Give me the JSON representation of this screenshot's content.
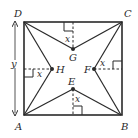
{
  "figure": {
    "type": "geometry-diagram",
    "colors": {
      "stroke": "#2a2a2a",
      "background": "#ffffff"
    }
  },
  "vertices": {
    "A": {
      "label": "A",
      "x": 24,
      "y": 115
    },
    "B": {
      "label": "B",
      "x": 121,
      "y": 115
    },
    "C": {
      "label": "C",
      "x": 122,
      "y": 22
    },
    "D": {
      "label": "D",
      "x": 24,
      "y": 22
    }
  },
  "interior_points": {
    "E": {
      "label": "E",
      "x": 73,
      "y": 89,
      "distance_label": "x",
      "side": "AB"
    },
    "F": {
      "label": "F",
      "x": 94,
      "y": 69,
      "distance_label": "x",
      "side": "BC"
    },
    "G": {
      "label": "G",
      "x": 73,
      "y": 49,
      "distance_label": "x",
      "side": "CD"
    },
    "H": {
      "label": "H",
      "x": 52,
      "y": 69,
      "distance_label": "x",
      "side": "DA"
    }
  },
  "dimension": {
    "label": "y",
    "from": "D",
    "to": "A"
  },
  "labels": {
    "A": "A",
    "B": "B",
    "C": "C",
    "D": "D",
    "E": "E",
    "F": "F",
    "G": "G",
    "H": "H",
    "x": "x",
    "y": "y"
  }
}
